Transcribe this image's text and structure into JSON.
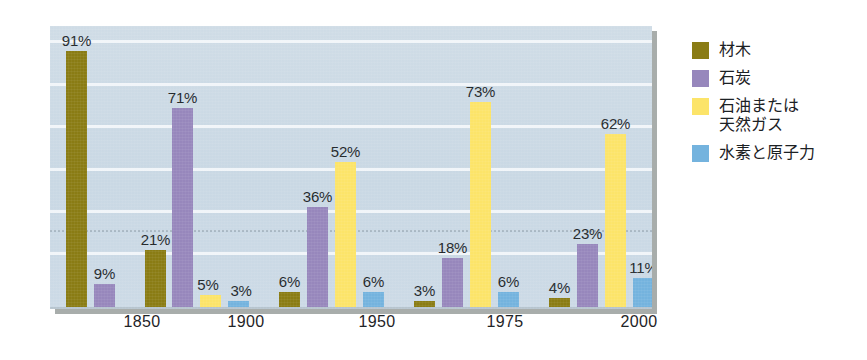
{
  "chart_data": {
    "type": "bar",
    "title": "",
    "subtitle": "",
    "xlabel": "",
    "ylabel": "",
    "ylim": [
      0,
      100
    ],
    "unit": "%",
    "grid": true,
    "legend_position": "right",
    "categories": [
      "1850",
      "1900",
      "1950",
      "1975",
      "2000"
    ],
    "series": [
      {
        "name": "材木",
        "color": "#8a7c14",
        "values": [
          91,
          21,
          6,
          3,
          4
        ],
        "labels": [
          "91%",
          "21%",
          "6%",
          "3%",
          "4%"
        ]
      },
      {
        "name": "石炭",
        "color": "#9787bc",
        "values": [
          9,
          71,
          36,
          18,
          23
        ],
        "labels": [
          "9%",
          "71%",
          "36%",
          "18%",
          "23%"
        ]
      },
      {
        "name": "石油または\n天然ガス",
        "color": "#fce469",
        "values": [
          0,
          5,
          52,
          73,
          62
        ],
        "labels": [
          "",
          "5%",
          "52%",
          "73%",
          "62%"
        ]
      },
      {
        "name": "水素と原子力",
        "color": "#74b3de",
        "values": [
          0,
          3,
          6,
          6,
          11
        ],
        "labels": [
          "",
          "3%",
          "6%",
          "6%",
          "11%"
        ]
      }
    ],
    "gridline_values": [
      20,
      35,
      50,
      65,
      80,
      95
    ],
    "dotted_gridline_value": 28,
    "plot_background": "#cbd9e5"
  },
  "legend": {
    "items": [
      {
        "label": "材木",
        "color": "#8a7c14"
      },
      {
        "label": "石炭",
        "color": "#9787bc"
      },
      {
        "label": "石油または\n天然ガス",
        "color": "#fce469"
      },
      {
        "label": "水素と原子力",
        "color": "#74b3de"
      }
    ]
  },
  "axis": {
    "x_tick_labels": [
      "1850",
      "1900",
      "1950",
      "1975",
      "2000"
    ]
  },
  "bars": [
    {
      "group": "1850",
      "series": "材木",
      "value": 91,
      "label": "91%",
      "color": "#8a7c14",
      "x": 16,
      "w": 21
    },
    {
      "group": "1850",
      "series": "石炭",
      "value": 9,
      "label": "9%",
      "color": "#9787bc",
      "x": 44,
      "w": 21
    },
    {
      "group": "1900",
      "series": "材木",
      "value": 21,
      "label": "21%",
      "color": "#8a7c14",
      "x": 95,
      "w": 21
    },
    {
      "group": "1900",
      "series": "石炭",
      "value": 71,
      "label": "71%",
      "color": "#9787bc",
      "x": 122,
      "w": 21
    },
    {
      "group": "1900",
      "series": "石油または天然ガス",
      "value": 5,
      "label": "5%",
      "color": "#fce469",
      "x": 150,
      "w": 21
    },
    {
      "group": "1900",
      "series": "水素と原子力",
      "value": 3,
      "label": "3%",
      "color": "#74b3de",
      "x": 178,
      "w": 21
    },
    {
      "group": "1950",
      "series": "材木",
      "value": 6,
      "label": "6%",
      "color": "#8a7c14",
      "x": 229,
      "w": 21
    },
    {
      "group": "1950",
      "series": "石炭",
      "value": 36,
      "label": "36%",
      "color": "#9787bc",
      "x": 257,
      "w": 21
    },
    {
      "group": "1950",
      "series": "石油または天然ガス",
      "value": 52,
      "label": "52%",
      "color": "#fce469",
      "x": 285,
      "w": 21
    },
    {
      "group": "1950",
      "series": "水素と原子力",
      "value": 6,
      "label": "6%",
      "color": "#74b3de",
      "x": 313,
      "w": 21
    },
    {
      "group": "1975",
      "series": "材木",
      "value": 3,
      "label": "3%",
      "color": "#8a7c14",
      "x": 364,
      "w": 21
    },
    {
      "group": "1975",
      "series": "石炭",
      "value": 18,
      "label": "18%",
      "color": "#9787bc",
      "x": 392,
      "w": 21
    },
    {
      "group": "1975",
      "series": "石油または天然ガス",
      "value": 73,
      "label": "73%",
      "color": "#fce469",
      "x": 420,
      "w": 21
    },
    {
      "group": "1975",
      "series": "水素と原子力",
      "value": 6,
      "label": "6%",
      "color": "#74b3de",
      "x": 448,
      "w": 21
    },
    {
      "group": "2000",
      "series": "材木",
      "value": 4,
      "label": "4%",
      "color": "#8a7c14",
      "x": 499,
      "w": 21
    },
    {
      "group": "2000",
      "series": "石炭",
      "value": 23,
      "label": "23%",
      "color": "#9787bc",
      "x": 527,
      "w": 21
    },
    {
      "group": "2000",
      "series": "石油または天然ガス",
      "value": 62,
      "label": "62%",
      "color": "#fce469",
      "x": 555,
      "w": 21
    },
    {
      "group": "2000",
      "series": "水素と原子力",
      "value": 11,
      "label": "11%",
      "color": "#74b3de",
      "x": 583,
      "w": 21
    }
  ],
  "xtick_positions": [
    92,
    196,
    327,
    455,
    589
  ]
}
